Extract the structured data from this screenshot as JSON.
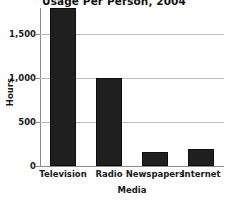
{
  "chart_data": {
    "type": "bar",
    "title": "Usage Per Person, 2004",
    "xlabel": "Media",
    "ylabel": "Hours",
    "categories": [
      "Television",
      "Radio",
      "Newspapers",
      "Internet"
    ],
    "values": [
      1800,
      1000,
      160,
      195
    ],
    "ylim": [
      0,
      1800
    ],
    "yticks": [
      0,
      500,
      1000,
      1500
    ],
    "ytick_labels": [
      "0",
      "500",
      "1,000",
      "1,500"
    ],
    "grid": true,
    "legend": "none",
    "bar_color": "#1f1f1f",
    "grid_color": "#bdbdbd",
    "axis_color": "#8a8a8a",
    "background_color": "#ffffff"
  }
}
